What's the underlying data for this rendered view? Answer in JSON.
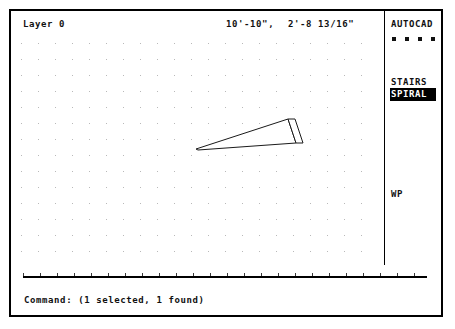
{
  "app": {
    "name": "AutoCAD"
  },
  "status_bar": {
    "layer_label": "Layer 0",
    "coordinate_x": "10'-10\",",
    "coordinate_y": "2'-8 13/16\""
  },
  "drawing": {
    "grid": {
      "spacing_x": 17,
      "spacing_y": 16,
      "dot_color": "#b9b9b9",
      "origin_x": 10,
      "origin_y": 10
    },
    "shape": {
      "name": "spiral-stair-tread",
      "stroke_color": "#1a1a1a",
      "fill_color": "#ffffff",
      "tread_points": "196,147 288,117 296,141 198,148",
      "riser_points": "288,117 295,117 303,141 296,141"
    }
  },
  "side_menu": {
    "title": "AUTOCAD",
    "bullet_count": 4,
    "bullet_positions": [
      0,
      13,
      26,
      39
    ],
    "items": [
      {
        "label": "STAIRS",
        "selected": false
      },
      {
        "label": "SPIRAL",
        "selected": true
      },
      {
        "label": "WP",
        "selected": false
      }
    ]
  },
  "divider": {
    "tick_count": 24,
    "tick_spacing": 17
  },
  "command_line": {
    "text": "Command: (1 selected, 1 found)"
  },
  "colors": {
    "background": "#ffffff",
    "foreground": "#000000",
    "highlight_bg": "#000000",
    "highlight_fg": "#ffffff",
    "grid_dot": "#b9b9b9"
  }
}
